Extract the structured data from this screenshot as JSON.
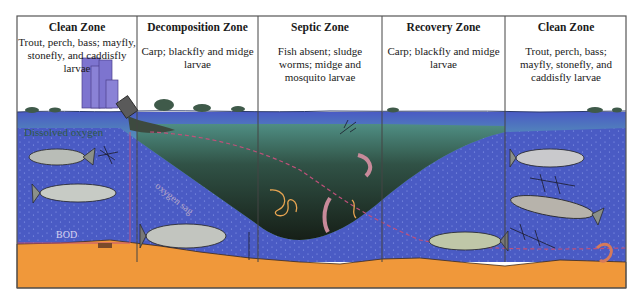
{
  "diagram": {
    "type": "river oxygen-sag zones",
    "zones": [
      {
        "title": "Clean Zone",
        "description": "Trout, perch, bass; mayfly, stonefly, and caddisfly larvae"
      },
      {
        "title": "Decomposition Zone",
        "description": "Carp; blackfly and midge larvae"
      },
      {
        "title": "Septic Zone",
        "description": "Fish absent; sludge worms; midge and mosquito larvae"
      },
      {
        "title": "Recovery Zone",
        "description": "Carp; blackfly and midge larvae"
      },
      {
        "title": "Clean Zone",
        "description": "Trout, perch, bass; mayfly, stonefly, and caddisfly larvae"
      }
    ],
    "annotations": {
      "dissolved_oxygen": "Dissolved oxygen",
      "oxygen_sag": "oxygen sag",
      "bod": "BOD"
    },
    "colors": {
      "frame": "#555555",
      "sky": "#ffffff",
      "surface_water": "#6fb6b0",
      "oxygen_water": "#4a5bc4",
      "polluted_water_top": "#4f8f80",
      "polluted_water_bottom": "#141b16",
      "sediment": "#f0983a",
      "bod_line": "#c0507a",
      "city": "#7d74cf"
    }
  }
}
